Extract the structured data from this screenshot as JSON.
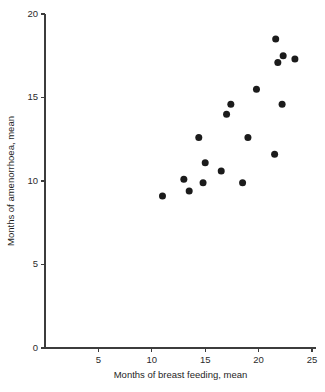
{
  "chart_data": {
    "type": "scatter",
    "title": "",
    "xlabel": "Months of breast feeding, mean",
    "ylabel": "Months of amenorrhoea, mean",
    "xlim": [
      0,
      26
    ],
    "ylim": [
      0,
      20
    ],
    "xticks": [
      5,
      10,
      15,
      20,
      25
    ],
    "xtick_labels": [
      "5",
      "10",
      "15",
      "20",
      "25"
    ],
    "yticks": [
      0,
      5,
      10,
      15,
      20
    ],
    "ytick_labels": [
      "0",
      "5",
      "10",
      "15",
      "20"
    ],
    "grid": false,
    "legend": null,
    "marker": "filled-circle",
    "marker_color": "#1b1b1b",
    "n_points": 18,
    "points": [
      {
        "x": 11.0,
        "y": 9.1
      },
      {
        "x": 13.0,
        "y": 10.1
      },
      {
        "x": 13.5,
        "y": 9.4
      },
      {
        "x": 14.4,
        "y": 12.6
      },
      {
        "x": 14.8,
        "y": 9.9
      },
      {
        "x": 15.0,
        "y": 11.1
      },
      {
        "x": 16.5,
        "y": 10.6
      },
      {
        "x": 17.0,
        "y": 14.0
      },
      {
        "x": 17.4,
        "y": 14.6
      },
      {
        "x": 18.5,
        "y": 9.9
      },
      {
        "x": 19.0,
        "y": 12.6
      },
      {
        "x": 19.8,
        "y": 15.5
      },
      {
        "x": 21.5,
        "y": 11.6
      },
      {
        "x": 21.6,
        "y": 18.5
      },
      {
        "x": 21.8,
        "y": 17.1
      },
      {
        "x": 22.2,
        "y": 14.6
      },
      {
        "x": 22.3,
        "y": 17.5
      },
      {
        "x": 23.4,
        "y": 17.3
      }
    ]
  },
  "figure": {
    "background_color": "#ffffff",
    "axis_color": "#3c3c3c"
  }
}
